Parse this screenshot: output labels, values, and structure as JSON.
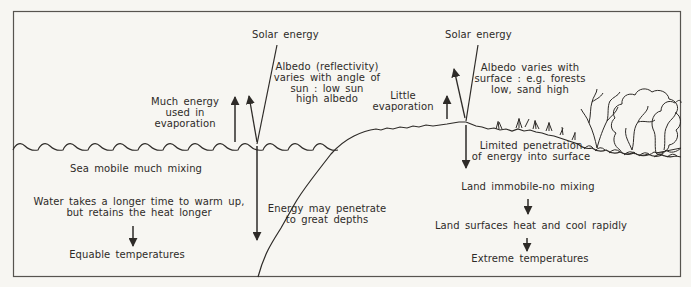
{
  "figure": {
    "paper": "#f7f6f2",
    "ink": "#2e2b28",
    "frame": "#57544f"
  },
  "labels": {
    "solar_sea": "Solar energy",
    "albedo_sea": [
      "Albedo (reflectivity)",
      "varies with angle of",
      "sun : low sun",
      "high albedo"
    ],
    "much_energy": [
      "Much energy",
      "used in",
      "evaporation"
    ],
    "little_evaporation": [
      "Little",
      "evaporation"
    ],
    "solar_land": "Solar energy",
    "albedo_land": [
      "Albedo varies with",
      "surface : e.g. forests",
      "low, sand high"
    ],
    "sea_mobile": "Sea mobile much mixing",
    "water_warm": [
      "Water takes a longer time to warm up,",
      "but retains the heat longer"
    ],
    "equable": "Equable temperatures",
    "energy_depths": [
      "Energy may penetrate",
      "to great depths"
    ],
    "limited_penetration": [
      "Limited penetration",
      "of energy into surface"
    ],
    "land_immobile": "Land immobile-no mixing",
    "land_heat_cool": "Land surfaces heat and cool rapidly",
    "extreme": "Extreme temperatures"
  }
}
